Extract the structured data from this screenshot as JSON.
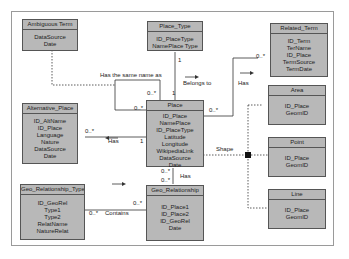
{
  "classes": {
    "ambiguous_term": {
      "name": "Ambiguous Term",
      "attrs": [
        "DataSource",
        "Date"
      ]
    },
    "place_type": {
      "name": "Place_Type",
      "attrs": [
        "ID_PlaceType",
        "NamePlace Type"
      ]
    },
    "related_term": {
      "name": "Related_Term",
      "attrs": [
        "ID_Term",
        "TerName",
        "ID_Place",
        "TermSource",
        "TermDate"
      ]
    },
    "area": {
      "name": "Area",
      "attrs": [
        "ID_Place",
        "GeomID"
      ]
    },
    "alternative_place": {
      "name": "Alternative_Place",
      "attrs": [
        "ID_AltName",
        "ID_Place",
        "Language",
        "Nature",
        "DataSource",
        "Date"
      ]
    },
    "place": {
      "name": "Place",
      "attrs": [
        "ID_Place",
        "NamePlace",
        "ID_PlaceType",
        "Latitude",
        "Longitude",
        "WikipediaLink",
        "DataSource",
        "Date"
      ]
    },
    "point": {
      "name": "Point",
      "attrs": [
        "ID_Place",
        "GeomID"
      ]
    },
    "geo_relationship_type": {
      "name": "Geo_Relationship_Type",
      "attrs": [
        "ID_GeoRel",
        "Type1",
        "Type2",
        "RelatName",
        "NatureRelat"
      ]
    },
    "geo_relationship": {
      "name": "Geo_Relationship",
      "attrs": [
        "ID_Place1",
        "ID_Place2",
        "ID_GeoRel",
        "Date"
      ]
    },
    "line": {
      "name": "Line",
      "attrs": [
        "ID_Place",
        "GeomID"
      ]
    }
  },
  "associations": {
    "same_name": "Has the same name as",
    "belongs_to": "Belongs to",
    "has_related": "Has",
    "has_alt": "Has",
    "shape": "Shape",
    "has_georel": "Has",
    "contains": "Contains"
  },
  "multiplicities": {
    "m_one": "1",
    "m_many": "0..*"
  }
}
